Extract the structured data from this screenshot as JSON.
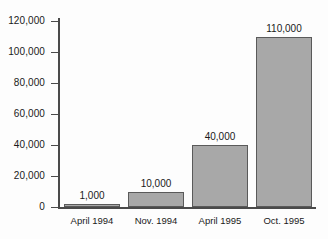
{
  "chart_data": {
    "type": "bar",
    "title": "",
    "subtitle": "",
    "xlabel": "",
    "ylabel": "",
    "categories": [
      "April 1994",
      "Nov. 1994",
      "April 1995",
      "Oct. 1995"
    ],
    "values": [
      1000,
      10000,
      40000,
      110000
    ],
    "value_labels": [
      "1,000",
      "10,000",
      "40,000",
      "110,000"
    ],
    "ylim": [
      0,
      120000
    ],
    "ytick_values": [
      0,
      20000,
      40000,
      60000,
      80000,
      100000,
      120000
    ],
    "ytick_labels": [
      "0",
      "20,000",
      "40,000",
      "60,000",
      "80,000",
      "100,000",
      "120,000"
    ],
    "grid": false,
    "legend": null,
    "series": [
      {
        "name": "",
        "values": [
          1000,
          10000,
          40000,
          110000
        ],
        "color": "#a8a8a8",
        "edge_color": "#5a5a5a"
      }
    ]
  },
  "axes": {
    "axis_color": "#4a4a4a"
  }
}
